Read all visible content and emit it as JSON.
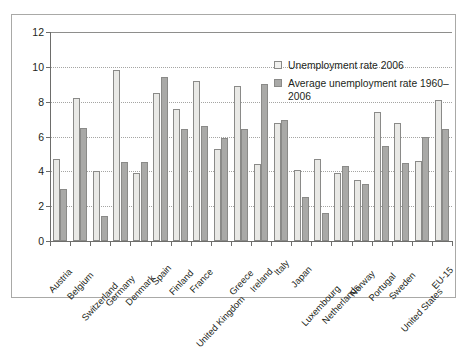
{
  "chart_data": {
    "type": "bar",
    "title": "",
    "xlabel": "",
    "ylabel": "",
    "ylim": [
      0,
      12
    ],
    "ytick_labels": [
      "0",
      "2",
      "4",
      "6",
      "8",
      "10",
      "12"
    ],
    "yticks": [
      0,
      2,
      4,
      6,
      8,
      10,
      12
    ],
    "grid": true,
    "grid_axis": "y",
    "legend_position": "upper-right-inside",
    "categories": [
      "Austria",
      "Belgium",
      "Switzerland",
      "Germany",
      "Denmark",
      "Spain",
      "Finland",
      "France",
      "United Kingdom",
      "Greece",
      "Ireland",
      "Italy",
      "Japan",
      "Luxembourg",
      "Netherlands",
      "Norway",
      "Portugal",
      "Sweden",
      "United States",
      "EU-15"
    ],
    "series": [
      {
        "name": "Unemployment rate 2006",
        "color": "#e9e9e6",
        "values": [
          4.7,
          8.2,
          4.0,
          9.8,
          3.9,
          8.5,
          7.6,
          9.2,
          5.3,
          8.9,
          4.4,
          6.8,
          4.1,
          4.7,
          3.9,
          3.5,
          7.4,
          6.8,
          4.6,
          8.1
        ]
      },
      {
        "name": "Average unemployment rate 1960–2006",
        "color": "#a9a9a7",
        "values": [
          3.0,
          6.5,
          1.45,
          4.55,
          4.55,
          9.4,
          6.45,
          6.6,
          5.9,
          6.45,
          9.0,
          6.95,
          2.5,
          1.6,
          4.3,
          3.3,
          5.45,
          4.5,
          5.95,
          6.45
        ]
      }
    ]
  },
  "legend": {
    "entries": [
      {
        "label": "Unemployment rate 2006",
        "swatch": "light-gray-square-icon"
      },
      {
        "label": "Average unemployment rate 1960–2006",
        "swatch": "dark-gray-square-icon"
      }
    ]
  }
}
